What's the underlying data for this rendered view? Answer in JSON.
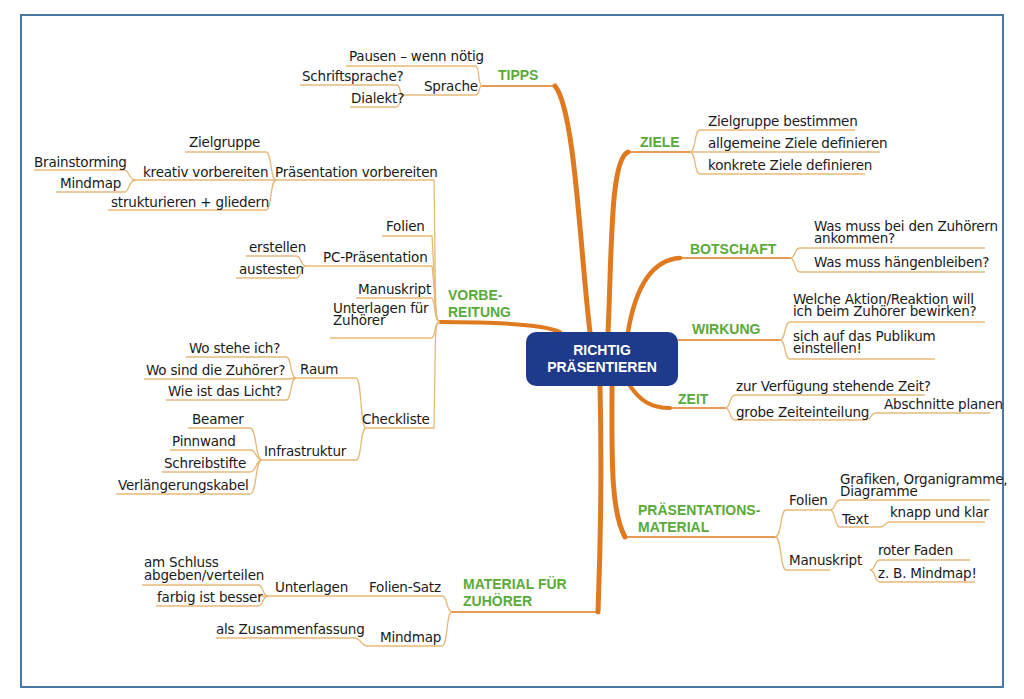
{
  "colors": {
    "hub": "#1e3a8a",
    "main_branch": "#e07a20",
    "sub_branch": "#e6b978",
    "main_label": "#5aaa3a",
    "frame": "#4a78a3"
  },
  "hub": {
    "line1": "RICHTIG",
    "line2": "PRÄSENTIEREN"
  },
  "tipps": {
    "label": "TIPPS",
    "pausen": "Pausen – wenn nötig",
    "sprache": "Sprache",
    "schriftsprache": "Schriftsprache?",
    "dialekt": "Dialekt?"
  },
  "vorbereitung": {
    "label1": "VORBE-",
    "label2": "REITUNG",
    "praesentation_vorbereiten": "Präsentation vorbereiten",
    "zielgruppe": "Zielgruppe",
    "kreativ": "kreativ vorbereiten",
    "brainstorming": "Brainstorming",
    "mindmap": "Mindmap",
    "strukturieren": "strukturieren + gliedern",
    "folien": "Folien",
    "pc_praesentation": "PC-Präsentation",
    "erstellen": "erstellen",
    "austesten": "austesten",
    "manuskript": "Manuskript",
    "unterlagen1": "Unterlagen für",
    "unterlagen2": "Zuhörer",
    "checkliste": "Checkliste",
    "raum": "Raum",
    "wo_stehe": "Wo stehe ich?",
    "wo_zuhoerer": "Wo sind die Zuhörer?",
    "licht": "Wie ist das Licht?",
    "infrastruktur": "Infrastruktur",
    "beamer": "Beamer",
    "pinnwand": "Pinnwand",
    "schreibstifte": "Schreibstifte",
    "kabel": "Verlängerungskabel"
  },
  "material_zuhoerer": {
    "label1": "MATERIAL FÜR",
    "label2": "ZUHÖRER",
    "folien_satz": "Folien-Satz",
    "unterlagen": "Unterlagen",
    "am_schluss1": "am Schluss",
    "am_schluss2": "abgeben/verteilen",
    "farbig": "farbig ist besser",
    "mindmap": "Mindmap",
    "zusammenfassung": "als Zusammenfassung"
  },
  "ziele": {
    "label": "ZIELE",
    "items": [
      "Zielgruppe bestimmen",
      "allgemeine Ziele definieren",
      "konkrete Ziele definieren"
    ]
  },
  "botschaft": {
    "label": "BOTSCHAFT",
    "item1_line1": "Was muss bei den Zuhörern",
    "item1_line2": "ankommen?",
    "item2": "Was muss hängenbleiben?"
  },
  "wirkung": {
    "label": "WIRKUNG",
    "item1_line1": "Welche Aktion/Reaktion will",
    "item1_line2": "ich beim Zuhörer bewirken?",
    "item2_line1": "sich auf das Publikum",
    "item2_line2": "einstellen!"
  },
  "zeit": {
    "label": "ZEIT",
    "item1": "zur Verfügung stehende Zeit?",
    "item2": "grobe Zeiteinteilung",
    "item2_sub": "Abschnitte planen"
  },
  "praesentationsmaterial": {
    "label1": "PRÄSENTATIONS-",
    "label2": "MATERIAL",
    "folien": "Folien",
    "grafiken1": "Grafiken, Organigramme,",
    "grafiken2": "Diagramme",
    "text": "Text",
    "knapp": "knapp und klar",
    "manuskript": "Manuskript",
    "roter_faden": "roter Faden",
    "mindmap": "z. B. Mindmap!"
  }
}
